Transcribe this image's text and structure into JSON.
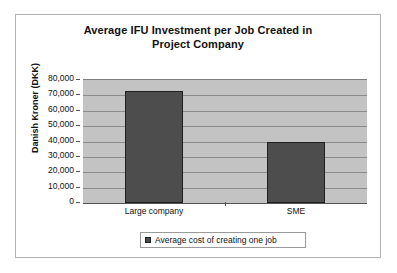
{
  "chart_data": {
    "type": "bar",
    "title": "Average IFU Investment per Job Created in Project Company",
    "title_line1": "Average IFU Investment per Job Created in",
    "title_line2": "Project Company",
    "categories": [
      "Large company",
      "SME"
    ],
    "values": [
      73000,
      40000
    ],
    "series": [
      {
        "name": "Average cost of creating one job",
        "values": [
          73000,
          40000
        ],
        "color": "#4d4d4d"
      }
    ],
    "xlabel": "",
    "ylabel": "Danish Kroner (DKK)",
    "ylim": [
      0,
      80000
    ],
    "ytick_step": 10000,
    "yticks": [
      80000,
      70000,
      60000,
      50000,
      40000,
      30000,
      20000,
      10000,
      0
    ],
    "ytick_labels": [
      "80,000",
      "70,000",
      "60,000",
      "50,000",
      "40,000",
      "30,000",
      "20,000",
      "10,000",
      "0"
    ],
    "grid": true,
    "grid_axis": "y",
    "legend": {
      "position": "bottom",
      "entries": [
        "Average cost of creating one job"
      ]
    },
    "plot_background": "#c3c3c3",
    "frame_background": "#ffffff",
    "bar_color": "#4d4d4d",
    "bar_border_color": "#1f1f1f"
  }
}
